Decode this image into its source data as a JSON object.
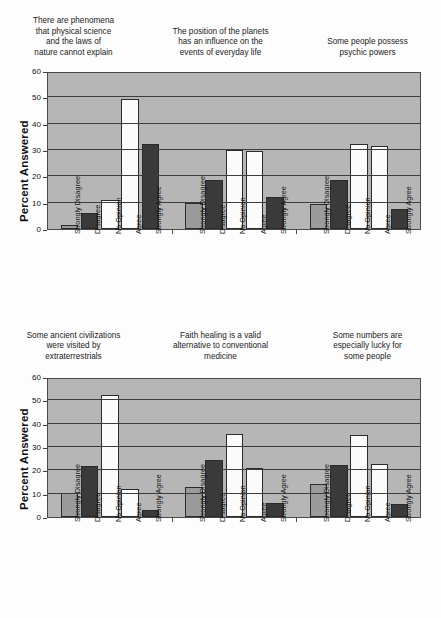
{
  "figure": {
    "axis_title": "Percent Answered",
    "categories": [
      "Strongly Disagree",
      "Disagree",
      "No Opinion",
      "Agree",
      "Strongly Agree"
    ],
    "y_ticks": [
      0,
      10,
      20,
      30,
      40,
      50,
      60
    ],
    "colors": {
      "plot_background": "#b6b6b6",
      "gridline": "#3d3d3d",
      "bar_gray": "#9b9b9b",
      "bar_dark": "#3a3a3a",
      "bar_white": "#fbfbfb",
      "page_background": "#fdfdfd",
      "text": "#1a1a1a"
    }
  },
  "chart_data": [
    {
      "type": "bar",
      "panel": "top",
      "title": "",
      "xlabel": "",
      "ylabel": "Percent Answered",
      "ylim": [
        0,
        60
      ],
      "yticks": [
        0,
        10,
        20,
        30,
        40,
        50,
        60
      ],
      "grid": true,
      "legend": "none",
      "categories": [
        "Strongly Disagree",
        "Disagree",
        "No Opinion",
        "Agree",
        "Strongly Agree"
      ],
      "groups": [
        {
          "name": "There are phenomena that physical science and the laws of nature cannot explain",
          "title_lines": [
            "There are phenomena",
            "that physical science",
            "and the laws of",
            "nature cannot explain"
          ],
          "values": [
            1.5,
            6.2,
            11.0,
            49.2,
            32.2
          ]
        },
        {
          "name": "The position of the planets has an influence on the events of everyday life",
          "title_lines": [
            "The position of the planets",
            "has an influence on the",
            "events of everyday life"
          ],
          "values": [
            10.0,
            18.6,
            30.1,
            29.7,
            12.0
          ]
        },
        {
          "name": "Some people possess psychic powers",
          "title_lines": [
            "Some people possess",
            "psychic powers"
          ],
          "values": [
            9.4,
            18.8,
            32.4,
            31.6,
            7.5
          ]
        }
      ]
    },
    {
      "type": "bar",
      "panel": "bottom",
      "title": "",
      "xlabel": "",
      "ylabel": "Percent Answered",
      "ylim": [
        0,
        60
      ],
      "yticks": [
        0,
        10,
        20,
        30,
        40,
        50,
        60
      ],
      "grid": true,
      "legend": "none",
      "categories": [
        "Strongly Disagree",
        "Disagree",
        "No Opinion",
        "Agree",
        "Strongly Agree"
      ],
      "groups": [
        {
          "name": "Some ancient civilizations were visited by extraterrestrials",
          "title_lines": [
            "Some ancient civilizations",
            "were visited by",
            "extraterrestrials"
          ],
          "values": [
            10.5,
            21.8,
            52.4,
            12.0,
            3.0
          ]
        },
        {
          "name": "Faith healing is a valid alternative to conventional medicine",
          "title_lines": [
            "Faith healing is a valid",
            "alternative to conventional",
            "medicine"
          ],
          "values": [
            13.0,
            24.5,
            35.5,
            20.8,
            6.2
          ]
        },
        {
          "name": "Some numbers are especially lucky for some people",
          "title_lines": [
            "Some numbers are",
            "especially lucky for",
            "some people"
          ],
          "values": [
            14.0,
            22.2,
            35.0,
            22.7,
            5.5
          ]
        }
      ]
    }
  ]
}
